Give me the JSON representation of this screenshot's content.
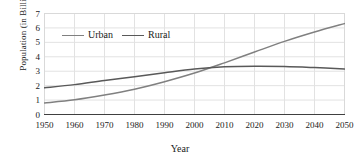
{
  "chart_data": {
    "type": "line",
    "title": "",
    "xlabel": "Year",
    "ylabel": "Population (in Billions)",
    "xlim": [
      1950,
      2050
    ],
    "ylim": [
      0,
      7
    ],
    "xticks": [
      1950,
      1960,
      1970,
      1980,
      1990,
      2000,
      2010,
      2020,
      2030,
      2040,
      2050
    ],
    "yticks": [
      0,
      1,
      2,
      3,
      4,
      5,
      6,
      7
    ],
    "grid": true,
    "legend_position": "top-left-inside",
    "x": [
      1950,
      1960,
      1970,
      1980,
      1990,
      2000,
      2010,
      2020,
      2030,
      2040,
      2050
    ],
    "series": [
      {
        "name": "Urban",
        "color": "#808080",
        "values": [
          0.8,
          1.02,
          1.35,
          1.75,
          2.27,
          2.87,
          3.58,
          4.33,
          5.07,
          5.72,
          6.3
        ]
      },
      {
        "name": "Rural",
        "color": "#595959",
        "values": [
          1.85,
          2.07,
          2.36,
          2.62,
          2.9,
          3.16,
          3.31,
          3.35,
          3.33,
          3.25,
          3.15
        ]
      }
    ],
    "annotations": [
      "Urban and Rural curves intersect near 2007 at approximately 3.3 billion"
    ]
  },
  "style": {
    "axis_color": "#404040",
    "grid_color": "#e2e2e2",
    "plot_border_color": "#d9d9d9",
    "background": "#ffffff"
  }
}
